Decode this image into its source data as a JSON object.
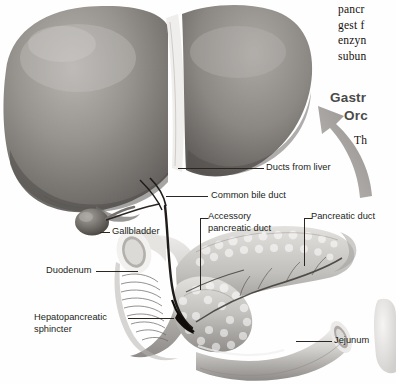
{
  "figure": {
    "style": "grayscale textbook illustration"
  },
  "body_text": {
    "lines": [
      "pancr",
      "gest f",
      "enzyn",
      "subun"
    ],
    "continuation": "Th"
  },
  "heading": {
    "line1": "Gastr",
    "line2": "Orc"
  },
  "labels": [
    {
      "id": "ducts-from-liver",
      "text": "Ducts from liver"
    },
    {
      "id": "common-bile-duct",
      "text": "Common bile duct"
    },
    {
      "id": "accessory-pancreatic-duct",
      "text_line1": "Accessory",
      "text_line2": "pancreatic duct"
    },
    {
      "id": "pancreatic-duct",
      "text": "Pancreatic duct"
    },
    {
      "id": "gallbladder",
      "text": "Gallbladder"
    },
    {
      "id": "duodenum",
      "text": "Duodenum"
    },
    {
      "id": "hepatopancreatic-sphincter",
      "text_line1": "Hepatopancreatic",
      "text_line2": "sphincter"
    },
    {
      "id": "jejunum",
      "text": "Jejunum"
    }
  ],
  "colors": {
    "background": "#fefefe",
    "label_text": "#231f20",
    "heading_text": "#4a4a4a",
    "body_text": "#15100e",
    "leader_line": "#2b2622",
    "organ_light": "#d8d5d2",
    "organ_mid": "#9b9894",
    "organ_dark": "#6a6764",
    "arrow": "#a9a6a3"
  }
}
